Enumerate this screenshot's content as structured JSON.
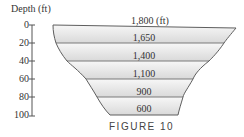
{
  "figure": {
    "caption": "FIGURE 10",
    "axis": {
      "title": "Depth (ft)",
      "ticks": [
        "0",
        "20",
        "40",
        "60",
        "80",
        "100"
      ]
    },
    "layers": [
      {
        "depth_top": 0,
        "depth_bottom": 20,
        "width_label": "1,800 (ft)"
      },
      {
        "depth_top": 20,
        "depth_bottom": 40,
        "width_label": "1,650"
      },
      {
        "depth_top": 40,
        "depth_bottom": 60,
        "width_label": "1,400"
      },
      {
        "depth_top": 60,
        "depth_bottom": 80,
        "width_label": "1,100"
      },
      {
        "depth_top": 80,
        "depth_bottom": 100,
        "width_label": "900"
      },
      {
        "depth_top": 100,
        "depth_bottom": 100,
        "width_label": "600"
      }
    ],
    "colors": {
      "fill_light": "#f4f4f4",
      "fill_dark": "#dcdcdc",
      "outline": "#6a6a6a"
    }
  }
}
